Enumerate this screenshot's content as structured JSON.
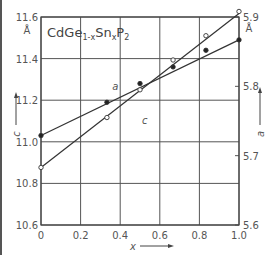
{
  "chart_data": {
    "type": "line",
    "title": "CdGe1-xSnxP2",
    "title_parts": {
      "base1": "CdGe",
      "sub1": "1-x",
      "base2": "Sn",
      "sub2": "x",
      "base3": "P",
      "sub3": "2"
    },
    "xlabel": "x",
    "ylabel_left": "c",
    "ylabel_right": "a",
    "left_unit": "Å",
    "right_unit": "Å",
    "xlim": [
      0,
      1.0
    ],
    "ylim_left": [
      10.6,
      11.6
    ],
    "ylim_right": [
      5.6,
      5.9
    ],
    "x_ticks": [
      "0",
      "0.2",
      "0.4",
      "0.6",
      "0.8",
      "1.0"
    ],
    "y_ticks_left": [
      "10.6",
      "10.8",
      "11.0",
      "11.2",
      "11.4",
      "11.6"
    ],
    "y_ticks_right": [
      "5.6",
      "5.7",
      "5.8",
      "5.9"
    ],
    "grid": true,
    "series": [
      {
        "name": "a",
        "annotation": "a",
        "marker": "filled-circle",
        "axis": "left",
        "x": [
          0,
          0.333,
          0.5,
          0.667,
          0.833,
          1.0
        ],
        "values": [
          11.03,
          11.19,
          11.28,
          11.36,
          11.44,
          11.49
        ],
        "fit_line": [
          [
            0,
            11.03
          ],
          [
            1.0,
            11.49
          ]
        ]
      },
      {
        "name": "c",
        "annotation": "c",
        "marker": "open-circle",
        "axis": "right",
        "x": [
          0,
          0.333,
          0.5,
          0.667,
          0.833,
          1.0
        ],
        "values": [
          5.683,
          5.755,
          5.795,
          5.838,
          5.873,
          5.908
        ],
        "fit_line": [
          [
            0,
            5.683
          ],
          [
            1.0,
            5.905
          ]
        ]
      }
    ]
  }
}
